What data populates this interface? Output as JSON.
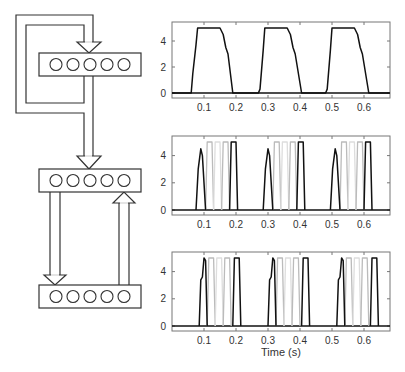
{
  "diagram": {
    "layers": [
      {
        "name": "recurrent-layer",
        "units": 5,
        "box": [
          39,
          53,
          102,
          23
        ]
      },
      {
        "name": "middle-layer",
        "units": 5,
        "box": [
          39,
          169,
          102,
          23
        ]
      },
      {
        "name": "bottom-layer",
        "units": 5,
        "box": [
          39,
          285,
          102,
          23
        ]
      }
    ],
    "stroke_color": "#333333",
    "fill_color": "#ffffff"
  },
  "chart_data": [
    {
      "type": "line",
      "title": "",
      "xlabel": "",
      "ylabel": "",
      "xlim": [
        0,
        0.68
      ],
      "ylim": [
        -0.3,
        5.3
      ],
      "yticks": [
        0,
        2,
        4
      ],
      "xticks": [
        0.1,
        0.2,
        0.3,
        0.4,
        0.5,
        0.6
      ],
      "series": [
        {
          "name": "recurrent-activity",
          "color": "#111111",
          "x": [
            0,
            0.06,
            0.065,
            0.075,
            0.08,
            0.15,
            0.16,
            0.168,
            0.175,
            0.19,
            0.27,
            0.275,
            0.285,
            0.29,
            0.36,
            0.37,
            0.378,
            0.385,
            0.405,
            0.48,
            0.485,
            0.495,
            0.5,
            0.57,
            0.58,
            0.588,
            0.595,
            0.615,
            0.68
          ],
          "y": [
            0,
            0,
            1.5,
            3.7,
            5,
            5,
            4.5,
            3.5,
            3,
            0,
            0,
            0.3,
            3.3,
            5,
            5,
            4.5,
            3.5,
            3,
            0,
            0,
            0.3,
            3.3,
            5,
            5,
            4.5,
            3.5,
            3,
            0,
            0
          ]
        }
      ]
    },
    {
      "type": "line",
      "xlim": [
        0,
        0.68
      ],
      "ylim": [
        -0.3,
        5.3
      ],
      "yticks": [
        0,
        2,
        4
      ],
      "xticks": [
        0.1,
        0.2,
        0.3,
        0.4,
        0.5,
        0.6
      ],
      "series": [
        {
          "name": "unit-1",
          "color": "#111111",
          "x": [
            0.075,
            0.082,
            0.09,
            0.095,
            0.105
          ],
          "y": [
            0,
            3.0,
            4.5,
            4.0,
            0
          ]
        },
        {
          "name": "unit-2",
          "color": "#bbbbbb",
          "x": [
            0.105,
            0.11,
            0.125,
            0.13
          ],
          "y": [
            0,
            5,
            5,
            0
          ]
        },
        {
          "name": "unit-3",
          "color": "#dddddd",
          "x": [
            0.13,
            0.135,
            0.15,
            0.155
          ],
          "y": [
            0,
            5,
            5,
            0
          ]
        },
        {
          "name": "unit-4",
          "color": "#bbbbbb",
          "x": [
            0.155,
            0.16,
            0.175,
            0.18
          ],
          "y": [
            0,
            5,
            5,
            0
          ]
        },
        {
          "name": "unit-5",
          "color": "#111111",
          "x": [
            0.18,
            0.185,
            0.2,
            0.205
          ],
          "y": [
            0,
            5,
            5,
            0
          ]
        }
      ],
      "period": 0.21,
      "repeats": 3
    },
    {
      "type": "line",
      "xlim": [
        0,
        0.68
      ],
      "ylim": [
        -0.3,
        5.3
      ],
      "yticks": [
        0,
        2,
        4
      ],
      "xticks": [
        0.1,
        0.2,
        0.3,
        0.4,
        0.5,
        0.6
      ],
      "xlabel": "Time (s)",
      "series": [
        {
          "name": "unit-1",
          "color": "#111111",
          "x": [
            0.085,
            0.09,
            0.095,
            0.1,
            0.105,
            0.11
          ],
          "y": [
            0,
            3.4,
            3.6,
            5,
            4.8,
            0
          ]
        },
        {
          "name": "unit-2",
          "color": "#bbbbbb",
          "x": [
            0.11,
            0.115,
            0.13,
            0.135
          ],
          "y": [
            0,
            5,
            5,
            0
          ]
        },
        {
          "name": "unit-3",
          "color": "#dddddd",
          "x": [
            0.135,
            0.14,
            0.155,
            0.16
          ],
          "y": [
            0,
            5,
            5,
            0
          ]
        },
        {
          "name": "unit-4",
          "color": "#bbbbbb",
          "x": [
            0.16,
            0.165,
            0.18,
            0.185
          ],
          "y": [
            0,
            5,
            5,
            0
          ]
        },
        {
          "name": "unit-5",
          "color": "#111111",
          "x": [
            0.19,
            0.195,
            0.21,
            0.215
          ],
          "y": [
            0,
            5,
            5,
            0
          ]
        }
      ],
      "period": 0.215,
      "repeats": 3
    }
  ],
  "labels": {
    "xlabel": "Time (s)",
    "yticks": [
      "0",
      "2",
      "4"
    ],
    "xticks": [
      "0.1",
      "0.2",
      "0.3",
      "0.4",
      "0.5",
      "0.6"
    ]
  }
}
